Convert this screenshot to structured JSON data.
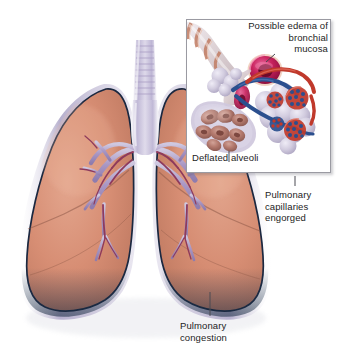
{
  "figure": {
    "background_color": "#ffffff"
  },
  "palette": {
    "lung_tissue": "#d3876e",
    "lung_tissue_light": "#e0a189",
    "lung_outline": "#1b2840",
    "pleura": "#b9b3cf",
    "lung_base_shadow": "#1d3350",
    "bronchi": "#9d89b8",
    "bronchial_vessel": "#8e3a5c",
    "trachea": "#c4bcd8",
    "alveoli_pale": "#c9c3da",
    "alveoli_deflated": "#b4776f",
    "mucosa_ring": "#c2205c",
    "artery_red": "#c0392b",
    "vein_blue": "#2b4f8e",
    "inset_border": "#9a9aa2",
    "label_text": "#1d1d1d",
    "leader_line": "#4a4a52"
  },
  "inset": {
    "name": "bronchiole-alveoli-detail-inset",
    "frame": {
      "x": 186,
      "y": 19,
      "width": 145,
      "height": 154
    }
  },
  "labels": [
    {
      "id": "edema-label",
      "name": "label-possible-edema",
      "lines": [
        "Possible edema of",
        "bronchial",
        "mucosa"
      ],
      "text": "Possible edema of\nbronchial\nmucosa",
      "align": "right",
      "x": 238,
      "y": 20,
      "width": 90,
      "leader": {
        "from": [
          268,
          52
        ],
        "to": [
          256,
          60
        ]
      }
    },
    {
      "id": "deflated-alveoli-label",
      "name": "label-deflated-alveoli",
      "lines": [
        "Deflated alveoli"
      ],
      "text": "Deflated alveoli",
      "align": "left",
      "x": 192,
      "y": 152,
      "width": 80,
      "leader": {
        "from": [
          228,
          150
        ],
        "to": [
          228,
          133
        ]
      }
    },
    {
      "id": "capillaries-label",
      "name": "label-pulmonary-capillaries-engorged",
      "lines": [
        "Pulmonary",
        "capillaries",
        "engorged"
      ],
      "text": "Pulmonary\ncapillaries\nengorged",
      "align": "left",
      "x": 265,
      "y": 189,
      "width": 72,
      "leader": {
        "from": [
          295,
          186
        ],
        "to": [
          295,
          143
        ]
      }
    },
    {
      "id": "congestion-label",
      "name": "label-pulmonary-congestion",
      "lines": [
        "Pulmonary",
        "congestion"
      ],
      "text": "Pulmonary\ncongestion",
      "align": "left",
      "x": 180,
      "y": 320,
      "width": 74,
      "leader": {
        "from": [
          210,
          317
        ],
        "to": [
          210,
          293
        ]
      }
    }
  ]
}
